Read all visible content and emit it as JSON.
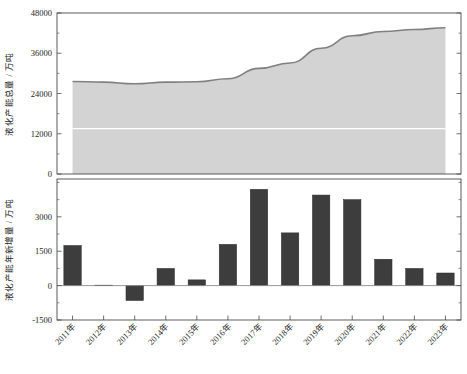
{
  "chart_data": [
    {
      "type": "area",
      "panel": "top",
      "title": "",
      "xlabel": "",
      "ylabel": "液化产能总量 / 万吨",
      "ylim": [
        0,
        48000
      ],
      "yticks": [
        0,
        12000,
        24000,
        36000,
        48000
      ],
      "ytick_labels": [
        "0",
        "12000",
        "24000",
        "36000",
        "48000"
      ],
      "y_minor_ticks": [
        6000,
        18000,
        30000,
        42000
      ],
      "grid": false,
      "white_gridline_value": 13500,
      "categories": [
        "2011年",
        "2012年",
        "2013年",
        "2014年",
        "2015年",
        "2016年",
        "2017年",
        "2018年",
        "2019年",
        "2020年",
        "2021年",
        "2022年",
        "2023年"
      ],
      "values": [
        27600,
        27400,
        26900,
        27400,
        27500,
        28400,
        31500,
        33100,
        37500,
        41200,
        42500,
        43100,
        43600
      ],
      "fill_color": "#d3d3d3",
      "line_color": "#808080",
      "legend": []
    },
    {
      "type": "bar",
      "panel": "bottom",
      "title": "",
      "xlabel": "",
      "ylabel": "液化产能年新增量 / 万吨",
      "ylim": [
        -1500,
        4650
      ],
      "yticks": [
        -1500,
        0,
        1500,
        3000
      ],
      "ytick_labels": [
        "-1500",
        "0",
        "1500",
        "3000"
      ],
      "y_minor_ticks": [
        -750,
        750,
        2250,
        3750,
        4500
      ],
      "grid": false,
      "categories": [
        "2011年",
        "2012年",
        "2013年",
        "2014年",
        "2015年",
        "2016年",
        "2017年",
        "2018年",
        "2019年",
        "2020年",
        "2021年",
        "2022年",
        "2023年"
      ],
      "values": [
        1750,
        20,
        -650,
        750,
        250,
        1800,
        4200,
        2300,
        3950,
        3750,
        1150,
        750,
        550
      ],
      "bar_color": "#3d3d3d",
      "legend": []
    }
  ],
  "axes": {
    "top": {
      "ylabel": "液化产能总量 / 万吨",
      "ytick_labels": [
        "0",
        "12000",
        "24000",
        "36000",
        "48000"
      ]
    },
    "bottom": {
      "ylabel": "液化产能年新增量 / 万吨",
      "ytick_labels": [
        "-1500",
        "0",
        "1500",
        "3000"
      ],
      "xtick_labels": [
        "2011年",
        "2012年",
        "2013年",
        "2014年",
        "2015年",
        "2016年",
        "2017年",
        "2018年",
        "2019年",
        "2020年",
        "2021年",
        "2022年",
        "2023年"
      ]
    }
  }
}
